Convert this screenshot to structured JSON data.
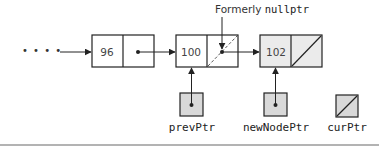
{
  "diagram": {
    "type": "linked-list-insertion",
    "ellipsis": "• • • •",
    "annotation": {
      "prefix": "Formerly ",
      "code": "nullptr"
    },
    "nodes": [
      {
        "value": "96",
        "next": "pointer",
        "shaded": false
      },
      {
        "value": "100",
        "next": "pointer (formerly null)",
        "shaded": false
      },
      {
        "value": "102",
        "next": "null",
        "shaded": true
      }
    ],
    "pointers": [
      {
        "label": "prevPtr",
        "points_to": "100",
        "state": "pointer"
      },
      {
        "label": "newNodePtr",
        "points_to": "102",
        "state": "pointer"
      },
      {
        "label": "curPtr",
        "points_to": null,
        "state": "null"
      }
    ],
    "colors": {
      "shaded_fill": "#d9d9d9",
      "new_node_fill": "#ebebeb",
      "line": "#222222",
      "rule": "#9a9a9a"
    }
  }
}
